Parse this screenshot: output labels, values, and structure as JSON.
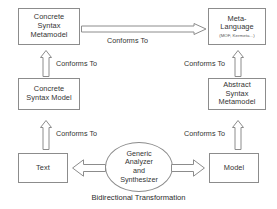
{
  "diagram": {
    "caption": "Bidirectional Transformation",
    "nodes": {
      "concrete_syntax_metamodel": {
        "label": "Concrete\nSyntax\nMetamodel"
      },
      "meta_language": {
        "label": "Meta-\nLanguage",
        "sub_label": "(MOF, Kermeta...)"
      },
      "concrete_syntax_model": {
        "label": "Concrete\nSyntax Model"
      },
      "abstract_syntax_metamodel": {
        "label": "Abstract\nSyntax\nMetamodel"
      },
      "text": {
        "label": "Text"
      },
      "model": {
        "label": "Model"
      },
      "generic_analyzer": {
        "label": "Generic\nAnalyzer\nand\nSynthesizer"
      }
    },
    "edges": {
      "csm_to_metalanguage": {
        "label": "Conforms To"
      },
      "csmodel_to_csmetamodel": {
        "label": "Conforms To"
      },
      "asmetamodel_to_metalanguage": {
        "label": "Conforms To"
      },
      "text_to_csmodel": {
        "label": "Conforms To"
      },
      "model_to_asmetamodel": {
        "label": "Conforms To"
      }
    },
    "colors": {
      "stroke": "#8c8c8c",
      "text": "#333333",
      "background": "#ffffff"
    }
  }
}
